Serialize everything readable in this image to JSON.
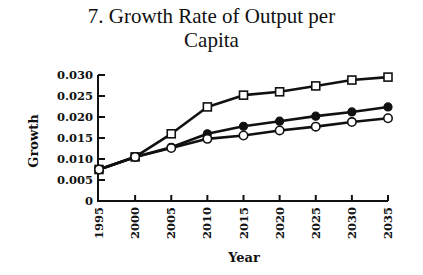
{
  "chart_data": {
    "type": "line",
    "title": "7. Growth Rate of Output per Capita",
    "title_lines": [
      "7. Growth Rate of Output per",
      "Capita"
    ],
    "xlabel": "Year",
    "ylabel": "Growth",
    "x": [
      1995,
      2000,
      2005,
      2010,
      2015,
      2020,
      2025,
      2030,
      2035
    ],
    "x_tick_labels": [
      "1995",
      "2000",
      "2005",
      "2010",
      "2015",
      "2020",
      "2025",
      "2030",
      "2035"
    ],
    "y_tick_labels": [
      "0",
      "0.005",
      "0.010",
      "0.015",
      "0.020",
      "0.025",
      "0.030"
    ],
    "ylim": [
      0,
      0.03
    ],
    "xlim": [
      1995,
      2035
    ],
    "grid": false,
    "legend": "none",
    "series": [
      {
        "name": "Open squares",
        "marker": "square-open",
        "values": [
          0.0075,
          0.0105,
          0.016,
          0.0224,
          0.0252,
          0.026,
          0.0274,
          0.0288,
          0.0295
        ]
      },
      {
        "name": "Filled circles",
        "marker": "circle-filled",
        "values": [
          0.0075,
          0.0105,
          0.0128,
          0.016,
          0.0178,
          0.019,
          0.0202,
          0.0212,
          0.0224
        ]
      },
      {
        "name": "Open circles",
        "marker": "circle-open",
        "values": [
          0.0075,
          0.0105,
          0.0126,
          0.0148,
          0.0156,
          0.0168,
          0.0177,
          0.0188,
          0.0197
        ]
      }
    ],
    "colors": {
      "line": "#111111",
      "background": "#ffffff"
    }
  }
}
